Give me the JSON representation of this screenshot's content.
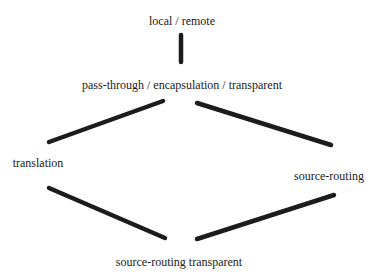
{
  "diagram": {
    "type": "lattice",
    "colors": {
      "background": "#ffffff",
      "edge": "#1c1c1c",
      "text": "#1a1a1a"
    },
    "nodes": [
      {
        "id": "local-remote",
        "label": "local / remote",
        "x": 182,
        "y": 21
      },
      {
        "id": "pass-through",
        "label": "pass-through / encapsulation / transparent",
        "x": 182,
        "y": 85
      },
      {
        "id": "translation",
        "label": "translation",
        "x": 38,
        "y": 163
      },
      {
        "id": "source-routing",
        "label": "source-routing",
        "x": 329,
        "y": 176
      },
      {
        "id": "source-routing-transparent",
        "label": "source-routing transparent",
        "x": 179,
        "y": 262
      }
    ],
    "edges": [
      {
        "from": "local-remote",
        "to": "pass-through",
        "x1": 181,
        "y1": 35,
        "x2": 181,
        "y2": 62
      },
      {
        "from": "pass-through",
        "to": "translation",
        "x1": 163,
        "y1": 101,
        "x2": 49,
        "y2": 142
      },
      {
        "from": "pass-through",
        "to": "source-routing",
        "x1": 197,
        "y1": 103,
        "x2": 331,
        "y2": 145
      },
      {
        "from": "translation",
        "to": "source-routing-transparent",
        "x1": 49,
        "y1": 188,
        "x2": 165,
        "y2": 238
      },
      {
        "from": "source-routing",
        "to": "source-routing-transparent",
        "x1": 334,
        "y1": 195,
        "x2": 197,
        "y2": 239
      }
    ]
  }
}
